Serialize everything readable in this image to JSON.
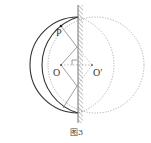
{
  "figure": {
    "caption": "图3",
    "labels": {
      "point_p": "P",
      "center_o": "O",
      "center_o_prime": "O′"
    },
    "colors": {
      "solid": "#333333",
      "dotted": "#9a9a9a",
      "hatch": "#8a8a8a"
    }
  }
}
